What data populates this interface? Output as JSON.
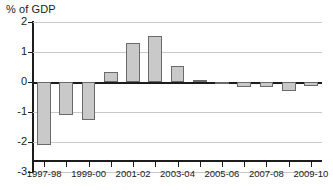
{
  "chart_data": {
    "type": "bar",
    "title": "% of GDP",
    "xlabel": "",
    "ylabel": "% of GDP",
    "ylim": [
      -3,
      2
    ],
    "yticks": [
      2,
      1,
      0,
      -1,
      -2,
      -3
    ],
    "ytick_labels": [
      "2",
      "1",
      "0",
      "-1",
      "-2",
      "-3"
    ],
    "grid": true,
    "legend": "none",
    "categories": [
      "1997-98",
      "1998-99",
      "1999-00",
      "2000-01",
      "2001-02",
      "2002-03",
      "2003-04",
      "2004-05",
      "2005-06",
      "2006-07",
      "2007-08",
      "2008-09",
      "2009-10"
    ],
    "tick_labels_shown": [
      "1997-98",
      "",
      "1999-00",
      "",
      "2001-02",
      "",
      "2003-04",
      "",
      "2005-06",
      "",
      "2007-08",
      "",
      "2009-10"
    ],
    "values": [
      -2.1,
      -1.1,
      -1.25,
      0.35,
      1.3,
      1.55,
      0.55,
      0.08,
      0.0,
      -0.15,
      -0.18,
      -0.3,
      -0.12
    ],
    "bar_fill_color": "#c9c9c9",
    "bar_border_color": "#6a6a6a",
    "grid_color": "#c9c9c9",
    "axis_color": "#1c1c1c",
    "background_color": "#ffffff"
  }
}
